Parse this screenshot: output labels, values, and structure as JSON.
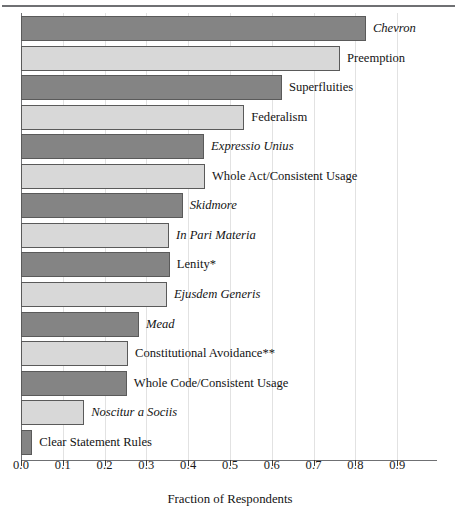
{
  "chart_data": {
    "type": "bar",
    "orientation": "horizontal",
    "title": "",
    "xlabel": "Fraction of Respondents",
    "ylabel": "",
    "xlim": [
      0.0,
      0.995
    ],
    "grid": "vertical-only",
    "legend": "none",
    "xticks": [
      "0.0",
      "0.1",
      "0.2",
      "0.3",
      "0.4",
      "0.5",
      "0.6",
      "0.7",
      "0.8",
      "0.9"
    ],
    "xtick_values": [
      0.0,
      0.1,
      0.2,
      0.3,
      0.4,
      0.5,
      0.6,
      0.7,
      0.8,
      0.9
    ],
    "colors": {
      "dark_bar": "#848484",
      "light_bar": "#d8d8d8",
      "bar_border": "#5a5a5a",
      "axis": "#6f7073",
      "gridline": "#e2e2e2",
      "text": "#141414"
    },
    "categories": [
      "Chevron",
      "Preemption",
      "Superfluities",
      "Federalism",
      "Expressio Unius",
      "Whole Act/Consistent Usage",
      "Skidmore",
      "In Pari Materia",
      "Lenity*",
      "Ejusdem Generis",
      "Mead",
      "Constitutional Avoidance**",
      "Whole Code/Consistent Usage",
      "Noscitur a Sociis",
      "Clear Statement Rules"
    ],
    "values": [
      0.825,
      0.763,
      0.624,
      0.534,
      0.438,
      0.44,
      0.387,
      0.354,
      0.356,
      0.349,
      0.282,
      0.256,
      0.253,
      0.151,
      0.027
    ],
    "bars": [
      {
        "label": "Chevron",
        "value": 0.825,
        "shade": "dark",
        "italic": true
      },
      {
        "label": "Preemption",
        "value": 0.763,
        "shade": "light",
        "italic": false
      },
      {
        "label": "Superfluities",
        "value": 0.624,
        "shade": "dark",
        "italic": false
      },
      {
        "label": "Federalism",
        "value": 0.534,
        "shade": "light",
        "italic": false
      },
      {
        "label": "Expressio Unius",
        "value": 0.438,
        "shade": "dark",
        "italic": true
      },
      {
        "label": "Whole Act/Consistent Usage",
        "value": 0.44,
        "shade": "light",
        "italic": false
      },
      {
        "label": "Skidmore",
        "value": 0.387,
        "shade": "dark",
        "italic": true
      },
      {
        "label": "In Pari Materia",
        "value": 0.354,
        "shade": "light",
        "italic": true
      },
      {
        "label": "Lenity*",
        "value": 0.356,
        "shade": "dark",
        "italic": false
      },
      {
        "label": "Ejusdem Generis",
        "value": 0.349,
        "shade": "light",
        "italic": true
      },
      {
        "label": "Mead",
        "value": 0.282,
        "shade": "dark",
        "italic": true
      },
      {
        "label": "Constitutional Avoidance**",
        "value": 0.256,
        "shade": "light",
        "italic": false
      },
      {
        "label": "Whole Code/Consistent Usage",
        "value": 0.253,
        "shade": "dark",
        "italic": false
      },
      {
        "label": "Noscitur a Sociis",
        "value": 0.151,
        "shade": "light",
        "italic": true
      },
      {
        "label": "Clear Statement Rules",
        "value": 0.027,
        "shade": "dark",
        "italic": false
      }
    ]
  }
}
